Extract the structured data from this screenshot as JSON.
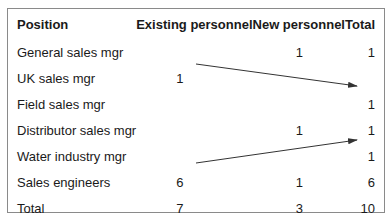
{
  "table": {
    "headers": {
      "position": "Position",
      "existing": "Existing personnel",
      "new": "New personnel",
      "total": "Total"
    },
    "rows": [
      {
        "position": "General sales mgr",
        "existing": "",
        "new": "1",
        "total": "1"
      },
      {
        "position": "UK sales mgr",
        "existing": "1",
        "new": "",
        "total": ""
      },
      {
        "position": "Field sales mgr",
        "existing": "",
        "new": "",
        "total": "1"
      },
      {
        "position": "Distributor sales mgr",
        "existing": "",
        "new": "1",
        "total": "1"
      },
      {
        "position": "Water industry mgr",
        "existing": "",
        "new": "",
        "total": "1"
      },
      {
        "position": "Sales engineers",
        "existing": "6",
        "new": "1",
        "total": "6"
      },
      {
        "position": "Total",
        "existing": "7",
        "new": "3",
        "total": "10"
      }
    ]
  },
  "annotations": {
    "arrows": [
      {
        "from": "UK sales mgr (Existing 1)",
        "to": "Field sales mgr (Total 1)"
      },
      {
        "from": "Sales engineers (Existing 6)",
        "to": "Water industry mgr (Total 1)"
      }
    ],
    "arrow_color": "#333333"
  }
}
